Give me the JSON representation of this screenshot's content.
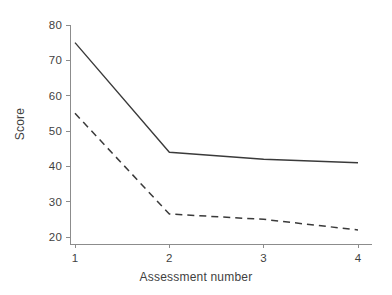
{
  "chart_data": {
    "type": "line",
    "title": "",
    "xlabel": "Assessment number",
    "ylabel": "Score",
    "x": [
      1,
      2,
      3,
      4
    ],
    "categories": [
      "1",
      "2",
      "3",
      "4"
    ],
    "xticklabels": [
      "1",
      "2",
      "3",
      "4"
    ],
    "yticklabels": [
      "20",
      "30",
      "40",
      "50",
      "60",
      "70",
      "80"
    ],
    "yticks": [
      20,
      30,
      40,
      50,
      60,
      70,
      80
    ],
    "xlim": [
      0.85,
      4.15
    ],
    "ylim": [
      18.5,
      81.5
    ],
    "grid": false,
    "legend": "none",
    "series": [
      {
        "name": "solid-series",
        "style": "solid",
        "color": "#3a3a3a",
        "values": [
          75,
          44,
          42,
          41
        ]
      },
      {
        "name": "dashed-series",
        "style": "dashed",
        "color": "#3a3a3a",
        "values": [
          55,
          26.5,
          25,
          22
        ]
      }
    ],
    "axis_color": "#8c8c8c",
    "background": "#ffffff"
  }
}
